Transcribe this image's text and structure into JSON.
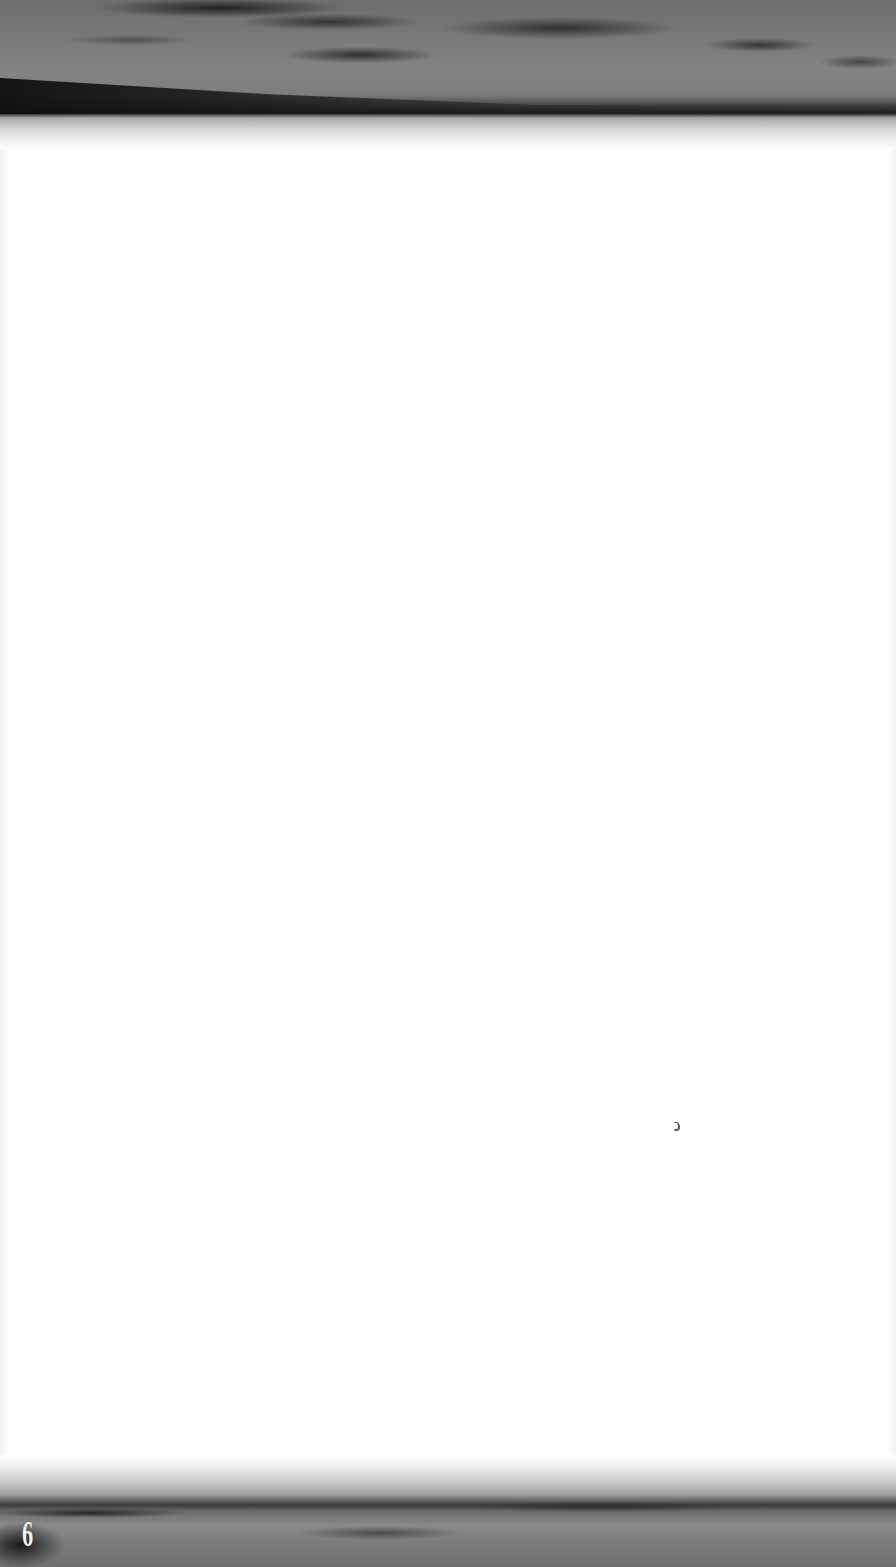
{
  "page": {
    "type": "scanned book page",
    "body_text": "",
    "page_number": "6"
  },
  "illustrations": {
    "top_band": "grayscale-seascape-sky-photo",
    "bottom_band": "grayscale-seascape-sky-photo"
  },
  "colors": {
    "page_background": "#ffffff",
    "band_dark": "#1a1a1a",
    "band_mid": "#7a7a7a",
    "page_number_color": "#f2f2f2"
  }
}
